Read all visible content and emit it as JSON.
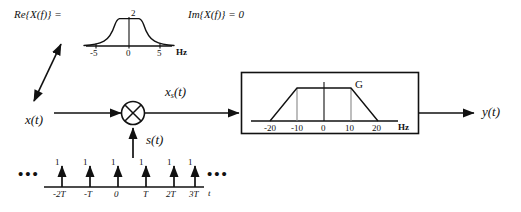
{
  "figure": {
    "type": "signal-processing-block-diagram",
    "ink_color": "#111111",
    "background": "#ffffff"
  },
  "input_spectrum": {
    "real_label": "Re{X(f)} =",
    "imag_label": "Im{X(f)} = 0",
    "peak_label": "2",
    "axis_unit": "Hz",
    "ticks": [
      "-5",
      "0",
      "5"
    ],
    "chart": {
      "type": "line",
      "title": "Re{X(f)}",
      "xlabel": "Hz",
      "ylabel": "",
      "xlim": [
        -7,
        7
      ],
      "ylim": [
        0,
        2.4
      ],
      "x": [
        -7,
        -5.6,
        -5,
        -4,
        -3,
        -2.2,
        -1.6,
        -1.2,
        -1.0,
        -0.6,
        0,
        0.6,
        1.0,
        1.2,
        1.6,
        2.2,
        3,
        4,
        5,
        5.6,
        7
      ],
      "y": [
        0,
        0.04,
        0.1,
        0.2,
        0.33,
        0.5,
        0.72,
        1.1,
        1.78,
        1.9,
        2.0,
        1.9,
        1.78,
        1.1,
        0.72,
        0.5,
        0.33,
        0.2,
        0.1,
        0.04,
        0
      ]
    }
  },
  "signals": {
    "input": "x(t)",
    "input_base": "x",
    "input_arg": "(t)",
    "sampled_base": "x",
    "sampled_sub": "s",
    "sampled_arg": "(t)",
    "sampling_base": "s",
    "sampling_arg": "(t)",
    "output_base": "y",
    "output_arg": "(t)"
  },
  "multiplier": {
    "symbol": "multiply-circle",
    "name": "modulator"
  },
  "filter_block": {
    "gain_label": "G",
    "axis_unit": "Hz",
    "ticks": [
      "-20",
      "-10",
      "0",
      "10",
      "20"
    ],
    "chart": {
      "type": "line",
      "title": "Reconstruction filter",
      "xlabel": "Hz",
      "ylabel": "G",
      "xlim": [
        -26,
        26
      ],
      "ylim": [
        0,
        1.25
      ],
      "x": [
        -20,
        -10,
        10,
        20
      ],
      "y": [
        0,
        1,
        1,
        0
      ],
      "passband": [
        -10,
        10
      ],
      "stopband_edges": [
        -20,
        20
      ],
      "gain": 1
    }
  },
  "impulse_train": {
    "axis_label": "t",
    "left_ellipsis": "•••",
    "right_ellipsis": "•••",
    "amplitude_label": "1",
    "chart": {
      "type": "bar",
      "categories": [
        "-2T",
        "-T",
        "0",
        "T",
        "2T",
        "3T"
      ],
      "values": [
        1,
        1,
        1,
        1,
        1,
        1
      ],
      "title": "s(t) impulse train",
      "xlabel": "t",
      "ylabel": "",
      "ylim": [
        0,
        1.3
      ]
    }
  }
}
